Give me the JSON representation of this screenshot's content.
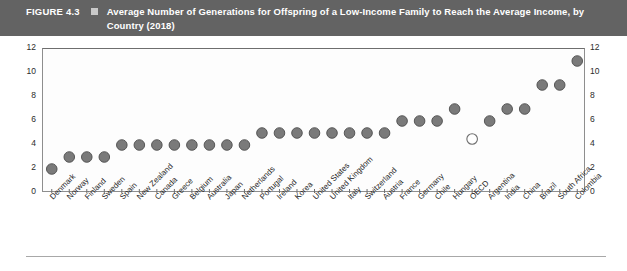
{
  "figure": {
    "number": "FIGURE 4.3",
    "marker_icon": "square-bullet-icon",
    "title": "Average Number of Generations for Offspring of a Low-Income Family to Reach the Average Income, by Country (2018)"
  },
  "colors": {
    "header_background": "#636363",
    "header_text": "#ffffff",
    "marker_fill": "#7a7a7a",
    "marker_stroke": "#4d4d4d",
    "highlight_marker_fill": "#ffffff",
    "highlight_marker_stroke": "#6e6e6e",
    "axis": "#6e6e6e",
    "plot_background": "#fdfdfd"
  },
  "chart_data": {
    "type": "scatter",
    "title": "Average Number of Generations for Offspring of a Low-Income Family to Reach the Average Income, by Country (2018)",
    "xlabel": "",
    "ylabel": "",
    "ylim": [
      0,
      12
    ],
    "yticks": [
      0,
      2,
      4,
      6,
      8,
      10,
      12
    ],
    "ytick_labels_left": [
      "0",
      "2",
      "4",
      "6",
      "8",
      "10",
      "12"
    ],
    "ytick_labels_right": [
      "0",
      "2",
      "4",
      "6",
      "8",
      "10",
      "12"
    ],
    "grid": false,
    "legend": "none",
    "dual_y_axis": true,
    "highlighted_category": "OECD",
    "highlight_style": "hollow-white-circle",
    "categories": [
      "Denmark",
      "Norway",
      "Finland",
      "Sweden",
      "Spain",
      "New Zealand",
      "Canada",
      "Greece",
      "Belgium",
      "Australia",
      "Japan",
      "Netherlands",
      "Portugal",
      "Ireland",
      "Korea",
      "United States",
      "United Kingdom",
      "Italy",
      "Switzerland",
      "Austria",
      "France",
      "Germany",
      "Chile",
      "Hungary",
      "OECD",
      "Argentina",
      "India",
      "China",
      "Brazil",
      "South Africa",
      "Colombia"
    ],
    "values": [
      2,
      3,
      3,
      3,
      4,
      4,
      4,
      4,
      4,
      4,
      4,
      4,
      5,
      5,
      5,
      5,
      5,
      5,
      5,
      5,
      6,
      6,
      6,
      7,
      4.5,
      6,
      7,
      7,
      9,
      9,
      11
    ]
  }
}
